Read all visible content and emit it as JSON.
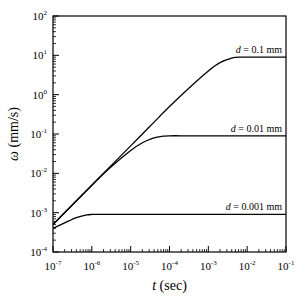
{
  "chart_data": {
    "type": "line",
    "title": "",
    "xlabel": "t (sec)",
    "xlabel_var": "t",
    "xlabel_unit": " (sec)",
    "ylabel": "ω (mm/s)",
    "ylabel_var": "ω",
    "ylabel_unit": " (mm/s)",
    "xscale": "log",
    "yscale": "log",
    "xlim": [
      1e-07,
      0.1
    ],
    "ylim": [
      0.0001,
      100.0
    ],
    "grid": false,
    "legend": "inline labels",
    "x_ticks": [
      {
        "exp": "-7",
        "value": 1e-07
      },
      {
        "exp": "-6",
        "value": 1e-06
      },
      {
        "exp": "-5",
        "value": 1e-05
      },
      {
        "exp": "-4",
        "value": 0.0001
      },
      {
        "exp": "-3",
        "value": 0.001
      },
      {
        "exp": "-2",
        "value": 0.01
      },
      {
        "exp": "-1",
        "value": 0.1
      }
    ],
    "y_ticks": [
      {
        "exp": "-4",
        "value": 0.0001
      },
      {
        "exp": "-3",
        "value": 0.001
      },
      {
        "exp": "-2",
        "value": 0.01
      },
      {
        "exp": "-1",
        "value": 0.1
      },
      {
        "exp": "0",
        "value": 1
      },
      {
        "exp": "1",
        "value": 10.0
      },
      {
        "exp": "2",
        "value": 100.0
      }
    ],
    "series": [
      {
        "name": "d = 0.1 mm",
        "label_var": "d",
        "label_rest": " = 0.1 mm",
        "x": [
          1e-07,
          3e-07,
          1e-06,
          3e-06,
          1e-05,
          3e-05,
          0.0001,
          0.0003,
          0.001,
          0.002,
          0.004,
          0.007,
          0.01,
          0.03,
          0.1
        ],
        "y": [
          0.0005,
          0.0015,
          0.005,
          0.015,
          0.05,
          0.15,
          0.5,
          1.4,
          4.0,
          6.5,
          8.5,
          9.0,
          9.0,
          9.0,
          9.0
        ]
      },
      {
        "name": "d = 0.01 mm",
        "label_var": "d",
        "label_rest": " = 0.01 mm",
        "x": [
          1e-07,
          3e-07,
          1e-06,
          3e-06,
          1e-05,
          2e-05,
          4e-05,
          7e-05,
          0.0001,
          0.0003,
          0.001,
          0.01,
          0.1
        ],
        "y": [
          0.0005,
          0.0015,
          0.005,
          0.014,
          0.038,
          0.06,
          0.08,
          0.088,
          0.09,
          0.09,
          0.09,
          0.09,
          0.09
        ]
      },
      {
        "name": "d = 0.001 mm",
        "label_var": "d",
        "label_rest": " = 0.001 mm",
        "x": [
          1e-07,
          2e-07,
          4e-07,
          7e-07,
          1e-06,
          3e-06,
          1e-05,
          0.0001,
          0.001,
          0.01,
          0.1
        ],
        "y": [
          0.0004,
          0.00055,
          0.00075,
          0.00087,
          0.0009,
          0.0009,
          0.0009,
          0.0009,
          0.0009,
          0.0009,
          0.0009
        ]
      }
    ]
  }
}
